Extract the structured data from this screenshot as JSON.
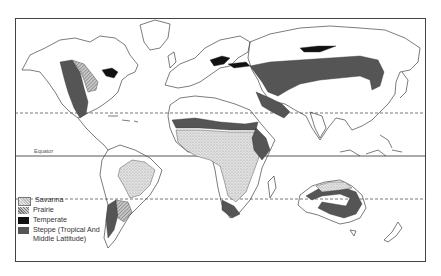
{
  "map": {
    "type": "world biome map",
    "reference_lines": [
      {
        "name": "Tropic of Cancer",
        "style": "dashed",
        "y": 113
      },
      {
        "name": "Equator",
        "style": "solid",
        "y": 156,
        "label": "Equator"
      },
      {
        "name": "Tropic of Capricorn",
        "style": "dashed",
        "y": 199
      }
    ],
    "equator_label": "Equator"
  },
  "legend": {
    "items": [
      {
        "label": "Savanna",
        "pattern": "stipple-light",
        "color": "#d8d8d8"
      },
      {
        "label": "Prairie",
        "pattern": "hatch",
        "color": "#9a9a9a"
      },
      {
        "label": "Temperate",
        "pattern": "solid",
        "color": "#111111"
      },
      {
        "label": "Steppe (Tropical And",
        "label_line2": "Middle Lattitude)",
        "pattern": "solid",
        "color": "#555555"
      }
    ]
  },
  "colors": {
    "coastline": "#444444",
    "savanna": "#d8d8d8",
    "prairie": "#a8a8a8",
    "temperate": "#111111",
    "steppe": "#555555"
  }
}
